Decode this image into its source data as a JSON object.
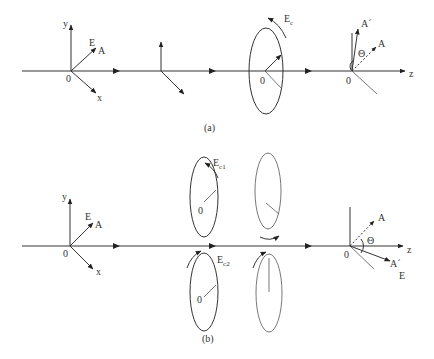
{
  "figure": {
    "panel_a": {
      "caption": "(a)",
      "left_frame": {
        "axis_y": "y",
        "axis_x": "x",
        "origin": "0",
        "field_E": "E",
        "field_A": "A"
      },
      "ellipse": {
        "origin": "0",
        "label_main": "E",
        "label_sub": "c"
      },
      "right_frame": {
        "origin": "0",
        "axis_z": "z",
        "vec_A_prime": "A´",
        "vec_A": "A",
        "angle": "Θ"
      }
    },
    "panel_b": {
      "caption": "(b)",
      "left_frame": {
        "axis_y": "y",
        "axis_x": "x",
        "origin": "0",
        "field_E": "E",
        "field_A": "A"
      },
      "ellipse_top": {
        "origin": "0",
        "label_main": "E",
        "label_sub": "c1"
      },
      "ellipse_bottom": {
        "origin": "0",
        "label_main": "E",
        "label_sub": "c2"
      },
      "right_frame": {
        "origin": "0",
        "axis_z": "z",
        "vec_A": "A",
        "vec_A_prime": "A´",
        "field_E": "E",
        "angle": "Θ"
      }
    }
  }
}
